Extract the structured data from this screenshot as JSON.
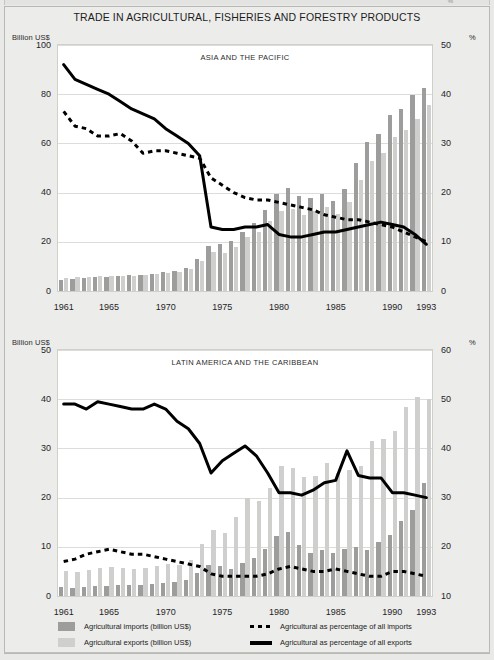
{
  "page": {
    "title": "TRADE IN AGRICULTURAL, FISHERIES AND FORESTRY PRODUCTS",
    "background_color": "#ececeb",
    "bar_import_color": "#9d9d9b",
    "bar_export_color": "#cfcfcd",
    "line_color": "#000000"
  },
  "legend": {
    "imports_bar": "Agricultural imports (billion US$)",
    "exports_bar": "Agricultural exports (billion US$)",
    "imports_pct_line": "Agricultural as percentage of  all imports",
    "exports_pct_line": "Agricultural as percentage of all exports"
  },
  "chart_data": [
    {
      "type": "bar",
      "title": "ASIA AND THE PACIFIC",
      "xlabel": "",
      "ylabel": "Billion US$",
      "y2label": "%",
      "ylim": [
        0,
        100
      ],
      "y2lim": [
        0,
        50
      ],
      "yticks": [
        0,
        20,
        40,
        60,
        80,
        100
      ],
      "y2ticks": [
        0,
        10,
        20,
        30,
        40,
        50
      ],
      "grid": true,
      "legend_position": "below-figure",
      "x": [
        1961,
        1962,
        1963,
        1964,
        1965,
        1966,
        1967,
        1968,
        1969,
        1970,
        1971,
        1972,
        1973,
        1974,
        1975,
        1976,
        1977,
        1978,
        1979,
        1980,
        1981,
        1982,
        1983,
        1984,
        1985,
        1986,
        1987,
        1988,
        1989,
        1990,
        1991,
        1992,
        1993
      ],
      "xtick_labels": [
        "1961",
        "1965",
        "1970",
        "1975",
        "1980",
        "1985",
        "1990",
        "1993"
      ],
      "xtick_years": [
        1961,
        1965,
        1970,
        1975,
        1980,
        1985,
        1990,
        1993
      ],
      "series": [
        {
          "name": "Agricultural imports (billion US$)",
          "kind": "bar",
          "axis": "left",
          "color": "#9d9d9b",
          "values": [
            4.5,
            4.8,
            5.2,
            5.6,
            5.9,
            6.1,
            6.4,
            6.6,
            7.0,
            7.6,
            8.2,
            9.2,
            13.0,
            18.5,
            19.0,
            20.5,
            24.0,
            27.5,
            33.0,
            39.5,
            42.0,
            38.5,
            38.0,
            39.5,
            36.5,
            41.5,
            52.0,
            60.5,
            64.0,
            71.5,
            74.0,
            79.5,
            82.5
          ]
        },
        {
          "name": "Agricultural exports (billion US$)",
          "kind": "bar",
          "axis": "left",
          "color": "#cfcfcd",
          "values": [
            5.4,
            5.5,
            5.8,
            6.0,
            6.2,
            6.3,
            6.2,
            6.4,
            6.8,
            7.4,
            7.8,
            8.8,
            12.0,
            16.0,
            15.5,
            18.0,
            22.0,
            24.0,
            28.5,
            32.5,
            33.5,
            31.0,
            32.5,
            34.0,
            31.5,
            36.0,
            45.0,
            53.0,
            56.0,
            62.5,
            65.5,
            70.0,
            75.5
          ]
        },
        {
          "name": "Agricultural as percentage of  all imports",
          "kind": "line-dashed",
          "axis": "right",
          "color": "#000000",
          "values": [
            36.5,
            33.5,
            33.0,
            31.5,
            31.5,
            32.0,
            30.5,
            28.0,
            28.5,
            28.5,
            28.0,
            27.5,
            27.0,
            23.0,
            21.5,
            20.0,
            19.0,
            18.5,
            18.5,
            18.0,
            17.5,
            17.0,
            16.5,
            15.5,
            15.0,
            14.5,
            14.5,
            14.0,
            13.5,
            13.0,
            12.0,
            11.0,
            10.0
          ]
        },
        {
          "name": "Agricultural as percentage of all exports",
          "kind": "line-solid",
          "axis": "right",
          "color": "#000000",
          "values": [
            46.0,
            43.0,
            42.0,
            41.0,
            40.0,
            38.5,
            37.0,
            36.0,
            35.0,
            33.0,
            31.5,
            30.0,
            27.5,
            13.0,
            12.5,
            12.5,
            13.0,
            13.0,
            13.5,
            11.5,
            11.0,
            11.0,
            11.5,
            12.0,
            12.0,
            12.5,
            13.0,
            13.5,
            14.0,
            13.5,
            13.0,
            11.5,
            9.5
          ]
        }
      ]
    },
    {
      "type": "bar",
      "title": "LATIN AMERICA AND THE CARIBBEAN",
      "xlabel": "",
      "ylabel": "Billion US$",
      "y2label": "%",
      "ylim": [
        0,
        50
      ],
      "y2lim": [
        10,
        60
      ],
      "yticks": [
        0,
        10,
        20,
        30,
        40,
        50
      ],
      "y2ticks": [
        10,
        20,
        30,
        40,
        50,
        60
      ],
      "grid": true,
      "legend_position": "below-figure",
      "x": [
        1961,
        1962,
        1963,
        1964,
        1965,
        1966,
        1967,
        1968,
        1969,
        1970,
        1971,
        1972,
        1973,
        1974,
        1975,
        1976,
        1977,
        1978,
        1979,
        1980,
        1981,
        1982,
        1983,
        1984,
        1985,
        1986,
        1987,
        1988,
        1989,
        1990,
        1991,
        1992,
        1993
      ],
      "xtick_labels": [
        "1961",
        "1965",
        "1970",
        "1975",
        "1980",
        "1985",
        "1990",
        "1993"
      ],
      "xtick_years": [
        1961,
        1965,
        1970,
        1975,
        1980,
        1985,
        1990,
        1993
      ],
      "series": [
        {
          "name": "Agricultural imports (billion US$)",
          "kind": "bar",
          "axis": "left",
          "color": "#9d9d9b",
          "values": [
            1.8,
            1.7,
            1.9,
            2.0,
            2.1,
            2.2,
            2.2,
            2.3,
            2.5,
            2.7,
            2.9,
            3.2,
            4.6,
            6.3,
            6.0,
            5.4,
            6.8,
            7.8,
            9.6,
            12.2,
            13.0,
            10.4,
            8.8,
            9.4,
            8.8,
            9.6,
            10.0,
            9.4,
            11.0,
            12.4,
            15.2,
            17.4,
            23.0
          ]
        },
        {
          "name": "Agricultural exports (billion US$)",
          "kind": "bar",
          "axis": "left",
          "color": "#cfcfcd",
          "values": [
            5.0,
            4.8,
            5.3,
            5.6,
            5.8,
            5.6,
            5.5,
            5.6,
            6.1,
            6.6,
            6.4,
            7.4,
            10.6,
            13.4,
            12.8,
            16.0,
            20.0,
            19.4,
            22.0,
            26.4,
            26.0,
            24.2,
            24.4,
            27.0,
            25.0,
            25.6,
            26.5,
            31.5,
            32.0,
            33.5,
            38.5,
            40.5,
            40.0
          ]
        },
        {
          "name": "Agricultural as percentage of  all imports",
          "kind": "line-dashed",
          "axis": "right",
          "color": "#000000",
          "values": [
            17.0,
            17.5,
            18.5,
            19.0,
            19.5,
            19.0,
            18.5,
            18.5,
            18.0,
            17.5,
            17.0,
            16.5,
            16.0,
            14.5,
            14.0,
            14.0,
            14.0,
            14.0,
            14.5,
            15.5,
            16.0,
            15.5,
            15.0,
            15.0,
            15.5,
            15.0,
            14.5,
            14.0,
            14.0,
            15.0,
            15.0,
            14.5,
            14.0
          ]
        },
        {
          "name": "Agricultural as percentage of all exports",
          "kind": "line-solid",
          "axis": "right",
          "color": "#000000",
          "values": [
            49.0,
            49.0,
            48.0,
            49.5,
            49.0,
            48.5,
            48.0,
            48.0,
            49.0,
            48.0,
            45.5,
            44.0,
            41.0,
            35.0,
            37.5,
            39.0,
            40.5,
            38.5,
            35.0,
            31.0,
            31.0,
            30.5,
            31.5,
            33.0,
            33.5,
            39.5,
            34.5,
            34.0,
            34.0,
            31.0,
            31.0,
            30.5,
            30.0
          ]
        }
      ]
    }
  ]
}
